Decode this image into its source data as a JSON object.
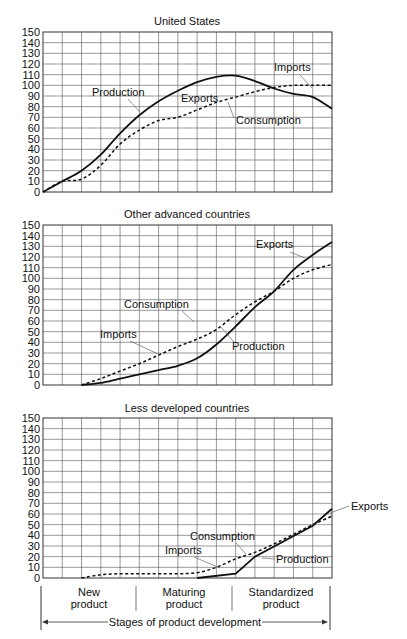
{
  "chart_data": [
    {
      "type": "line",
      "title": "United States",
      "xlabel": "",
      "ylabel": "",
      "ylim": [
        0,
        150
      ],
      "yticks": [
        0,
        10,
        20,
        30,
        40,
        50,
        60,
        70,
        80,
        90,
        100,
        110,
        120,
        130,
        140,
        150
      ],
      "grid": true,
      "x": [
        0,
        1,
        2,
        3,
        4,
        5,
        6,
        7,
        8,
        9,
        10,
        11,
        12,
        13,
        14,
        15
      ],
      "series": [
        {
          "name": "Production",
          "style": "solid",
          "x": [
            0,
            1,
            2,
            3,
            4,
            5,
            6,
            7,
            8,
            9,
            10,
            11,
            12,
            13,
            14,
            15
          ],
          "values": [
            0,
            10,
            20,
            35,
            55,
            72,
            85,
            95,
            103,
            108,
            109,
            104,
            97,
            92,
            89,
            78
          ]
        },
        {
          "name": "Consumption",
          "style": "dashed",
          "x": [
            0,
            1,
            2,
            3,
            4,
            5,
            6,
            7,
            8,
            9,
            10,
            11,
            12,
            13,
            14,
            15
          ],
          "values": [
            0,
            10,
            12,
            25,
            45,
            58,
            67,
            70,
            77,
            84,
            89,
            94,
            98,
            100,
            100,
            100
          ]
        }
      ],
      "annotations": [
        "Production",
        "Exports",
        "Consumption",
        "Imports"
      ]
    },
    {
      "type": "line",
      "title": "Other advanced countries",
      "xlabel": "",
      "ylabel": "",
      "ylim": [
        0,
        150
      ],
      "yticks": [
        0,
        10,
        20,
        30,
        40,
        50,
        60,
        70,
        80,
        90,
        100,
        110,
        120,
        130,
        140,
        150
      ],
      "grid": true,
      "series": [
        {
          "name": "Production",
          "style": "solid",
          "x": [
            2,
            3,
            4,
            5,
            6,
            7,
            8,
            9,
            10,
            11,
            12,
            13,
            14,
            15
          ],
          "values": [
            0,
            2,
            6,
            10,
            14,
            18,
            25,
            38,
            55,
            73,
            88,
            108,
            122,
            134
          ]
        },
        {
          "name": "Consumption",
          "style": "dashed",
          "x": [
            2,
            3,
            4,
            5,
            6,
            7,
            8,
            9,
            10,
            11,
            12,
            13,
            14,
            15
          ],
          "values": [
            0,
            6,
            13,
            20,
            28,
            36,
            43,
            52,
            66,
            78,
            88,
            100,
            108,
            113
          ]
        }
      ],
      "annotations": [
        "Exports",
        "Consumption",
        "Imports",
        "Production"
      ]
    },
    {
      "type": "line",
      "title": "Less developed countries",
      "xlabel": "Stages of product development",
      "ylabel": "",
      "ylim": [
        0,
        150
      ],
      "yticks": [
        0,
        10,
        20,
        30,
        40,
        50,
        60,
        70,
        80,
        90,
        100,
        110,
        120,
        130,
        140,
        150
      ],
      "grid": true,
      "series": [
        {
          "name": "Production",
          "style": "solid",
          "x": [
            8,
            10,
            11,
            14,
            15
          ],
          "values": [
            0,
            4,
            20,
            49,
            65
          ]
        },
        {
          "name": "Consumption",
          "style": "dashed",
          "x": [
            2,
            3,
            4,
            5,
            6,
            7,
            8,
            9,
            10,
            11,
            12,
            13,
            14,
            15
          ],
          "values": [
            0,
            3,
            4,
            4,
            4,
            4,
            5,
            10,
            18,
            24,
            32,
            41,
            50,
            58
          ]
        }
      ],
      "annotations": [
        "Exports",
        "Consumption",
        "Imports",
        "Production"
      ],
      "stages": [
        "New product",
        "Maturing product",
        "Standardized product"
      ]
    }
  ],
  "charts": {
    "us": {
      "title": "United States",
      "labels": {
        "production": "Production",
        "exports": "Exports",
        "consumption": "Consumption",
        "imports": "Imports"
      }
    },
    "oac": {
      "title": "Other advanced countries",
      "labels": {
        "exports": "Exports",
        "consumption": "Consumption",
        "imports": "Imports",
        "production": "Production"
      }
    },
    "ldc": {
      "title": "Less developed countries",
      "labels": {
        "exports": "Exports",
        "consumption": "Consumption",
        "imports": "Imports",
        "production": "Production"
      }
    }
  },
  "yticks": [
    "150",
    "140",
    "130",
    "120",
    "110",
    "100",
    "90",
    "80",
    "70",
    "60",
    "50",
    "40",
    "30",
    "20",
    "10",
    "0"
  ],
  "stages": {
    "new_line1": "New",
    "new_line2": "product",
    "maturing_line1": "Maturing",
    "maturing_line2": "product",
    "standardized_line1": "Standardized",
    "standardized_line2": "product",
    "axis_label": "Stages of product development"
  }
}
